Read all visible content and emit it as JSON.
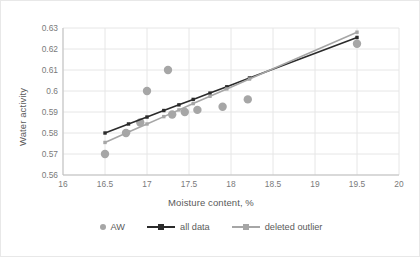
{
  "chart_data": {
    "type": "scatter",
    "title": "",
    "xlabel": "Moisture content, %",
    "ylabel": "Water activity",
    "xlim": [
      16,
      20
    ],
    "ylim": [
      0.56,
      0.63
    ],
    "xticks": [
      "16",
      "16.5",
      "17",
      "17.5",
      "18",
      "18.5",
      "19",
      "19.5",
      "20"
    ],
    "xtick_values": [
      16,
      16.5,
      17,
      17.5,
      18,
      18.5,
      19,
      19.5,
      20
    ],
    "yticks": [
      "0.56",
      "0.57",
      "0.58",
      "0.59",
      "0.6",
      "0.61",
      "0.62",
      "0.63"
    ],
    "ytick_values": [
      0.56,
      0.57,
      0.58,
      0.59,
      0.6,
      0.61,
      0.62,
      0.63
    ],
    "grid": true,
    "legend_position": "bottom",
    "series": [
      {
        "name": "AW",
        "type": "scatter",
        "marker": "circle",
        "color": "#a6a6a6",
        "points": [
          [
            16.5,
            0.57
          ],
          [
            16.75,
            0.58
          ],
          [
            16.92,
            0.585
          ],
          [
            17.0,
            0.6
          ],
          [
            17.25,
            0.61
          ],
          [
            17.3,
            0.5888
          ],
          [
            17.45,
            0.59
          ],
          [
            17.6,
            0.591
          ],
          [
            17.9,
            0.5925
          ],
          [
            18.2,
            0.596
          ],
          [
            19.5,
            0.6225
          ]
        ]
      },
      {
        "name": "all data",
        "type": "line",
        "marker": "square",
        "color": "#2b2b2b",
        "points": [
          [
            16.5,
            0.58
          ],
          [
            16.78,
            0.5843
          ],
          [
            17.0,
            0.5876
          ],
          [
            17.2,
            0.5907
          ],
          [
            17.38,
            0.5934
          ],
          [
            17.55,
            0.596
          ],
          [
            17.75,
            0.599
          ],
          [
            17.95,
            0.602
          ],
          [
            18.22,
            0.6062
          ],
          [
            19.5,
            0.6255
          ]
        ]
      },
      {
        "name": "deleted outlier",
        "type": "line",
        "marker": "square",
        "color": "#a6a6a6",
        "points": [
          [
            16.5,
            0.5755
          ],
          [
            16.78,
            0.5805
          ],
          [
            17.0,
            0.5843
          ],
          [
            17.2,
            0.5878
          ],
          [
            17.38,
            0.591
          ],
          [
            17.55,
            0.594
          ],
          [
            17.75,
            0.5975
          ],
          [
            17.95,
            0.601
          ],
          [
            18.22,
            0.6057
          ],
          [
            19.5,
            0.628
          ]
        ]
      }
    ]
  },
  "axes": {
    "x_title": "Moisture content, %",
    "y_title": "Water activity"
  },
  "legend": {
    "items": [
      {
        "label": "AW",
        "marker": "scatter-dot",
        "color": "#a6a6a6"
      },
      {
        "label": "all data",
        "marker": "line-with-square",
        "color": "#2b2b2b"
      },
      {
        "label": "deleted outlier",
        "marker": "line-with-square",
        "color": "#a6a6a6"
      }
    ]
  },
  "colors": {
    "grid": "#e6e6e6",
    "axis": "#bfbfbf",
    "tick_text": "#7a7a7a",
    "title_text": "#595959",
    "scatter": "#a6a6a6",
    "line_all_data": "#2b2b2b",
    "line_deleted_outlier": "#a6a6a6",
    "frame": "#e8e8e8",
    "background": "#ffffff"
  }
}
